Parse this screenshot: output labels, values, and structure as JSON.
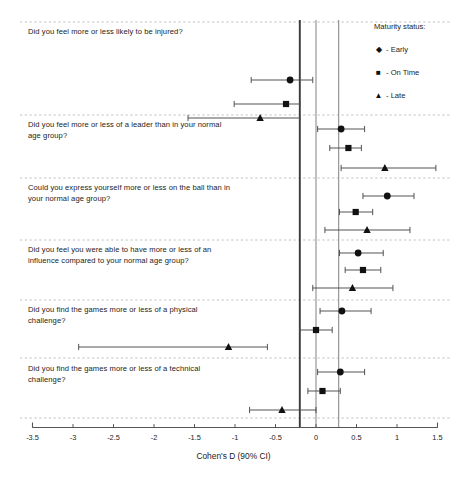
{
  "figure": {
    "type": "forest-plot",
    "axis_title": "Cohen's D (90% CI)"
  },
  "legend": {
    "title": "Maturity status:",
    "items": [
      {
        "marker": "diamond-marker",
        "glyph": "◆",
        "label": "- Early"
      },
      {
        "marker": "square-marker",
        "glyph": "■",
        "label": "- On Time"
      },
      {
        "marker": "triangle-marker",
        "glyph": "▲",
        "label": "- Late"
      }
    ]
  },
  "axis": {
    "label": "Cohen's D (90% CI)",
    "min": -3.5,
    "max": 1.5,
    "ticks": [
      -3.5,
      -3,
      -2.5,
      -2,
      -1.5,
      -1,
      -0.5,
      0,
      0.5,
      1,
      1.5
    ],
    "tick_labels": [
      "-3.5",
      "-3",
      "-2.5",
      "-2",
      "-1.5",
      "-1",
      "-0.5",
      "0",
      "0.5",
      "1",
      "1.5"
    ]
  },
  "reference_lines": [
    {
      "name": "negative-threshold-line",
      "value": -0.2,
      "color": "#3a3a3a"
    },
    {
      "name": "zero-line",
      "value": 0.0,
      "color": "#8c8c8c"
    },
    {
      "name": "positive-threshold-line",
      "value": 0.28,
      "color": "#8c8c8c"
    }
  ],
  "chart_data": {
    "type": "scatter",
    "title": "",
    "xlabel": "Cohen's D (90% CI)",
    "ylabel": "",
    "xlim": [
      -3.5,
      1.5
    ],
    "grid": false,
    "legend_position": "top-right",
    "series_names": [
      "Early",
      "On Time",
      "Late"
    ],
    "panels": [
      {
        "question": "Did you feel more or less likely to be injured?",
        "points": [
          {
            "series": "Early",
            "estimate": -0.32,
            "ci_low": -0.8,
            "ci_high": -0.04
          },
          {
            "series": "On Time",
            "estimate": -0.37,
            "ci_low": -1.01,
            "ci_high": -0.2
          },
          {
            "series": "Late",
            "estimate": -0.69,
            "ci_low": -1.58,
            "ci_high": -0.2
          }
        ]
      },
      {
        "question": "Did you feel more or less of a leader than in your normal\nage group?",
        "points": [
          {
            "series": "Early",
            "estimate": 0.31,
            "ci_low": 0.02,
            "ci_high": 0.6
          },
          {
            "series": "On Time",
            "estimate": 0.4,
            "ci_low": 0.17,
            "ci_high": 0.56
          },
          {
            "series": "Late",
            "estimate": 0.85,
            "ci_low": 0.31,
            "ci_high": 1.48
          }
        ]
      },
      {
        "question": "Could you express yourself more or less on the ball than in\nyour normal age group?",
        "points": [
          {
            "series": "Early",
            "estimate": 0.88,
            "ci_low": 0.58,
            "ci_high": 1.21
          },
          {
            "series": "On Time",
            "estimate": 0.49,
            "ci_low": 0.29,
            "ci_high": 0.7
          },
          {
            "series": "Late",
            "estimate": 0.63,
            "ci_low": 0.11,
            "ci_high": 1.16
          }
        ]
      },
      {
        "question": "Did you feel you were able to have more or less of an\ninfluence compared to your normal age group?",
        "points": [
          {
            "series": "Early",
            "estimate": 0.52,
            "ci_low": 0.29,
            "ci_high": 0.83
          },
          {
            "series": "On Time",
            "estimate": 0.58,
            "ci_low": 0.36,
            "ci_high": 0.8
          },
          {
            "series": "Late",
            "estimate": 0.45,
            "ci_low": -0.04,
            "ci_high": 0.95
          }
        ]
      },
      {
        "question": "Did you find the games more or less of a physical\nchallenge?",
        "points": [
          {
            "series": "Early",
            "estimate": 0.32,
            "ci_low": 0.05,
            "ci_high": 0.68
          },
          {
            "series": "On Time",
            "estimate": 0.0,
            "ci_low": -0.2,
            "ci_high": 0.2
          },
          {
            "series": "Late",
            "estimate": -1.08,
            "ci_low": -2.93,
            "ci_high": -0.6
          }
        ]
      },
      {
        "question": "Did you find the games more or less of a technical\nchallenge?",
        "points": [
          {
            "series": "Early",
            "estimate": 0.3,
            "ci_low": 0.02,
            "ci_high": 0.6
          },
          {
            "series": "On Time",
            "estimate": 0.08,
            "ci_low": -0.1,
            "ci_high": 0.3
          },
          {
            "series": "Late",
            "estimate": -0.42,
            "ci_low": -0.82,
            "ci_high": 0.0
          }
        ]
      }
    ]
  }
}
